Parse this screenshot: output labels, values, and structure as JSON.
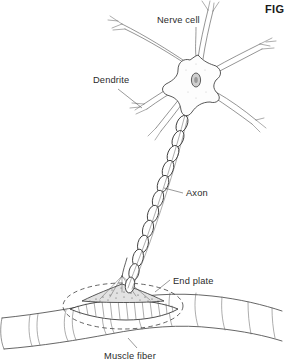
{
  "figure": {
    "caption_label": "FIG",
    "title": "Nerve cell and motor end plate on muscle fiber",
    "background_color": "#ffffff",
    "ink_color": "#3a3a3a",
    "label_color": "#2b2b2b"
  },
  "labels": {
    "nerve_cell": "Nerve cell",
    "dendrite": "Dendrite",
    "axon": "Axon",
    "end_plate": "End plate",
    "muscle_fiber": "Muscle fiber"
  },
  "structures": {
    "soma": "nerve-cell-body",
    "nucleus": "cell-nucleus",
    "dendrites_count": 6,
    "axon": "myelinated-axon",
    "myelin_segments": 13,
    "end_plate": "motor-end-plate",
    "muscle_fiber": "striated-muscle-fiber"
  }
}
